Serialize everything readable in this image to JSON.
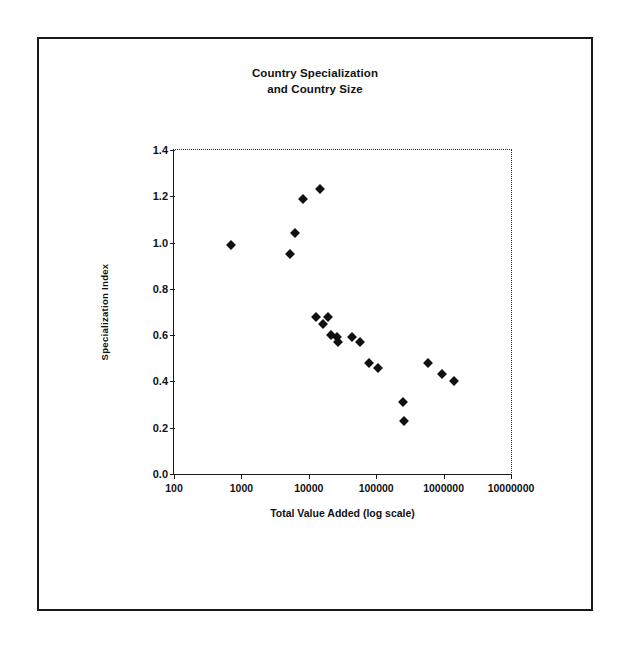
{
  "chart_data": {
    "type": "scatter",
    "title": "Country Specialization and Country Size",
    "title_lines": [
      "Country Specialization",
      "and Country Size"
    ],
    "xlabel": "Total Value Added (log scale)",
    "ylabel": "Specialization Index",
    "xscale": "log",
    "xlim": [
      100,
      10000000
    ],
    "ylim": [
      0.0,
      1.4
    ],
    "xticks": [
      100,
      1000,
      10000,
      100000,
      1000000,
      10000000
    ],
    "xtick_labels": [
      "100",
      "1000",
      "10000",
      "100000",
      "1000000",
      "10000000"
    ],
    "yticks": [
      0.0,
      0.2,
      0.4,
      0.6,
      0.8,
      1.0,
      1.2,
      1.4
    ],
    "ytick_labels": [
      "0.0",
      "0.2",
      "0.4",
      "0.6",
      "0.8",
      "1.0",
      "1.2",
      "1.4"
    ],
    "grid": false,
    "legend": null,
    "marker": "diamond",
    "marker_color": "#111111",
    "points": [
      {
        "x": 700,
        "y": 0.99
      },
      {
        "x": 5300,
        "y": 0.95
      },
      {
        "x": 6200,
        "y": 1.04
      },
      {
        "x": 8100,
        "y": 1.19
      },
      {
        "x": 14500,
        "y": 1.23
      },
      {
        "x": 13000,
        "y": 0.68
      },
      {
        "x": 16000,
        "y": 0.65
      },
      {
        "x": 19000,
        "y": 0.68
      },
      {
        "x": 21000,
        "y": 0.6
      },
      {
        "x": 26000,
        "y": 0.59
      },
      {
        "x": 27000,
        "y": 0.57
      },
      {
        "x": 44000,
        "y": 0.59
      },
      {
        "x": 57000,
        "y": 0.57
      },
      {
        "x": 78000,
        "y": 0.48
      },
      {
        "x": 105000,
        "y": 0.46
      },
      {
        "x": 250000,
        "y": 0.31
      },
      {
        "x": 260000,
        "y": 0.23
      },
      {
        "x": 580000,
        "y": 0.48
      },
      {
        "x": 950000,
        "y": 0.43
      },
      {
        "x": 1450000,
        "y": 0.4
      }
    ]
  },
  "figure": {
    "frame_color": "#1a1a1a",
    "background": "#ffffff"
  }
}
